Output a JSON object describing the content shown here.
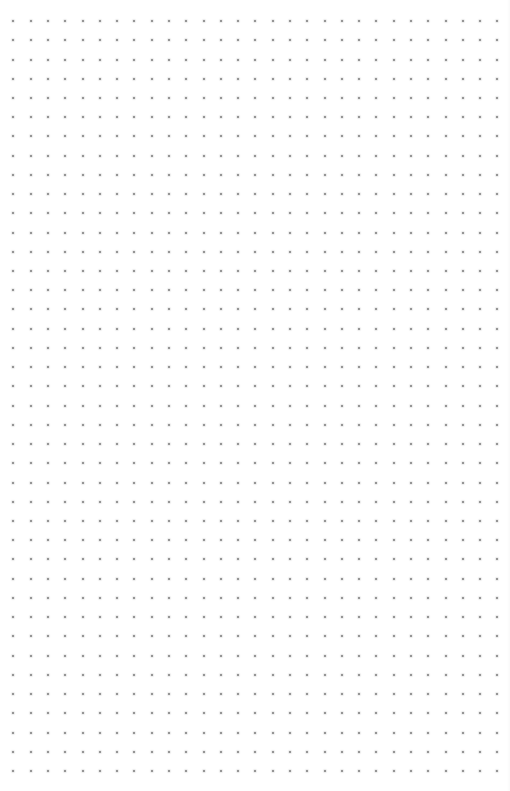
{
  "page": {
    "type": "dot-grid-paper",
    "background_color": "#ffffff"
  },
  "dot_grid": {
    "columns": 29,
    "rows": 40,
    "origin_x": 13.3,
    "origin_y": 21,
    "spacing_x": 17.29,
    "spacing_y": 19.23,
    "dot_size": 2,
    "dot_color": "#7a7a7a"
  }
}
